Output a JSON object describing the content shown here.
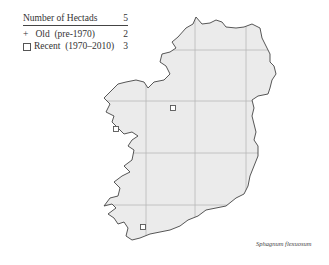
{
  "legend": {
    "header_label": "Number of Hectads",
    "header_count": "5",
    "rows": [
      {
        "symbol": "+",
        "label": "Old  (pre-1970)",
        "count": "2"
      },
      {
        "symbol": "square",
        "label": "Recent  (1970–2010)",
        "count": "3"
      }
    ]
  },
  "species_name": "Sphagnum flexuosum",
  "map": {
    "land_color": "#ebebeb",
    "grid_color": "#b8b8b8",
    "coast_color": "#444444",
    "grid_vertical_x": [
      146,
      195,
      246
    ],
    "grid_horizontal_y": [
      50,
      101,
      153,
      205
    ],
    "records_recent": [
      {
        "x": 173,
        "y": 108
      },
      {
        "x": 116,
        "y": 129
      },
      {
        "x": 143,
        "y": 227
      }
    ],
    "records_old": []
  }
}
